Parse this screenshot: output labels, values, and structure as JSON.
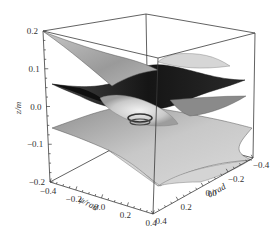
{
  "chart_data": {
    "type": "surface3d",
    "title": "",
    "xlabel": "ψ/rad",
    "ylabel": "θ/rad",
    "zlabel": "z/m",
    "xlim": [
      -0.4,
      0.4
    ],
    "ylim": [
      -0.4,
      0.4
    ],
    "zlim": [
      -0.2,
      0.2
    ],
    "x_ticks": [
      "-0.4",
      "-0.2",
      "0.0",
      "0.2",
      "0.4"
    ],
    "y_ticks": [
      "-0.4",
      "-0.2",
      "0.0",
      "0.2",
      "0.4"
    ],
    "z_ticks": [
      "0.2",
      "0.1",
      "0.0",
      "-0.1",
      "-0.2"
    ],
    "x_tick_values": [
      -0.4,
      -0.2,
      0.0,
      0.2,
      0.4
    ],
    "y_tick_values": [
      -0.4,
      -0.2,
      0.0,
      0.2,
      0.4
    ],
    "z_tick_values": [
      0.2,
      0.1,
      0.0,
      -0.1,
      -0.2
    ],
    "surfaces": [
      {
        "name": "upper surface",
        "description": "saddle surface, highest at ψ corners",
        "z_center": 0.05,
        "z_range": [
          -0.02,
          0.2
        ],
        "color": "#a9a9a9"
      },
      {
        "name": "middle surface",
        "description": "dark saddle surface near z = 0.02",
        "z_center": 0.02,
        "z_range": [
          -0.05,
          0.08
        ],
        "color": "#1e1e1e"
      },
      {
        "name": "lower surface",
        "description": "light saddle surface, lowest at θ corners",
        "z_center": -0.04,
        "z_range": [
          -0.2,
          0.02
        ],
        "color": "#bcbcbc"
      }
    ],
    "grid": false,
    "legend": "none",
    "box": true
  }
}
